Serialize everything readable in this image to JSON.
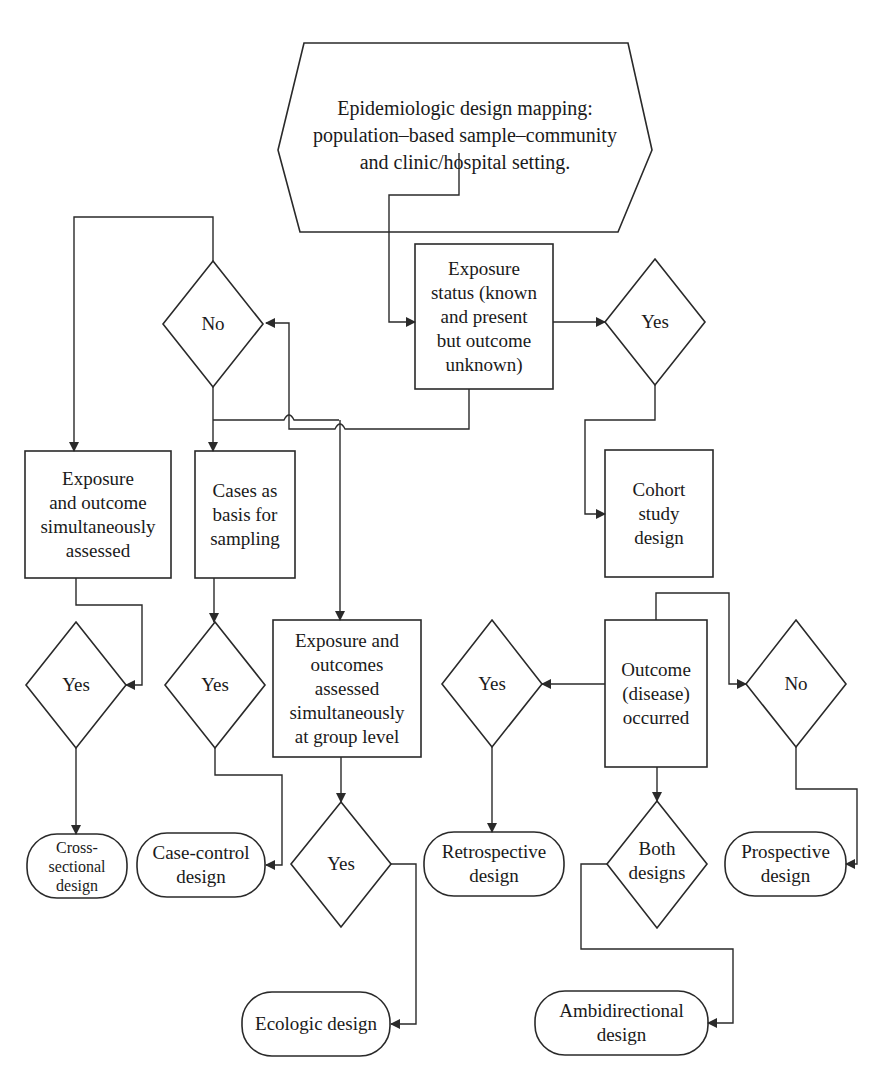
{
  "colors": {
    "stroke": "#2a2a2a",
    "text": "#1a1a1a",
    "background": "#ffffff"
  },
  "start": {
    "lines": [
      "Epidemiologic design mapping:",
      "population–based sample–community",
      "and clinic/hospital setting."
    ]
  },
  "process": {
    "exposure_status": {
      "lines": [
        "Exposure",
        "status (known",
        "and present",
        "but outcome",
        "unknown)"
      ]
    },
    "exposure_outcome_simultaneous": {
      "lines": [
        "Exposure",
        "and outcome",
        "simultaneously",
        "assessed"
      ]
    },
    "cases_sampling": {
      "lines": [
        "Cases as",
        "basis for",
        "sampling"
      ]
    },
    "group_level": {
      "lines": [
        "Exposure and",
        "outcomes",
        "assessed",
        "simultaneously",
        "at group level"
      ]
    },
    "cohort": {
      "lines": [
        "Cohort",
        "study",
        "design"
      ]
    },
    "outcome_occurred": {
      "lines": [
        "Outcome",
        "(disease)",
        "occurred"
      ]
    }
  },
  "decisions": {
    "no_top": "No",
    "yes_top": "Yes",
    "yes_cross": "Yes",
    "yes_case": "Yes",
    "yes_ecologic": "Yes",
    "yes_retro": "Yes",
    "no_prospective": "No",
    "both": [
      "Both",
      "designs"
    ]
  },
  "terminals": {
    "cross_sectional": [
      "Cross-",
      "sectional",
      "design"
    ],
    "case_control": [
      "Case-control",
      "design"
    ],
    "ecologic": [
      "Ecologic design"
    ],
    "retrospective": [
      "Retrospective",
      "design"
    ],
    "prospective": [
      "Prospective",
      "design"
    ],
    "ambidirectional": [
      "Ambidirectional",
      "design"
    ]
  }
}
